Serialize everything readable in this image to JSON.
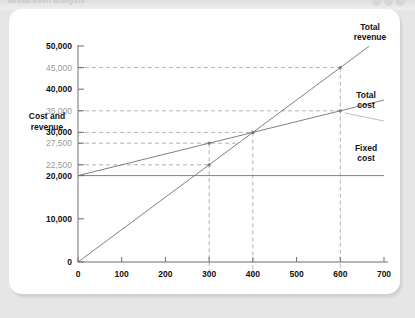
{
  "window": {
    "title": "Break-even analysis",
    "dots": [
      "window-dot",
      "window-dot",
      "window-dot"
    ]
  },
  "chart_data": {
    "type": "line",
    "title": "",
    "xlabel": "Sales per year",
    "ylabel": "Cost and revenue",
    "ylabel_line1": "Cost and",
    "ylabel_line2": "revenue",
    "xlim": [
      0,
      700
    ],
    "ylim": [
      0,
      50000
    ],
    "grid": false,
    "legend_position": "right-inline-labels",
    "x_ticks": [
      0,
      100,
      200,
      300,
      400,
      500,
      600,
      700
    ],
    "x_tick_labels": [
      "0",
      "100",
      "200",
      "300",
      "400",
      "500",
      "600",
      "700"
    ],
    "y_ticks_major": [
      0,
      10000,
      20000,
      30000,
      40000,
      50000
    ],
    "y_tick_labels_major": [
      "0",
      "10,000",
      "20,000",
      "30,000",
      "40,000",
      "50,000"
    ],
    "y_ticks_annotation": [
      22500,
      27500,
      35000,
      45000
    ],
    "y_tick_labels_annotation": [
      "22,500",
      "27,500",
      "35,000",
      "45,000"
    ],
    "series": [
      {
        "name": "Total revenue",
        "label": "Total revenue",
        "label_line1": "Total",
        "label_line2": "revenue",
        "color": "#808080",
        "intercept": 0,
        "slope_per_unit": 75,
        "x": [
          0,
          700
        ],
        "values": [
          0,
          52500
        ],
        "points": [
          {
            "x": 300,
            "y": 22500
          },
          {
            "x": 400,
            "y": 30000
          },
          {
            "x": 600,
            "y": 45000
          }
        ]
      },
      {
        "name": "Total cost",
        "label": "Total cost",
        "label_line1": "Total",
        "label_line2": "cost",
        "color": "#808080",
        "intercept": 20000,
        "slope_per_unit": 25,
        "x": [
          0,
          700
        ],
        "values": [
          20000,
          37500
        ],
        "points": [
          {
            "x": 300,
            "y": 27500
          },
          {
            "x": 400,
            "y": 30000
          },
          {
            "x": 600,
            "y": 35000
          }
        ]
      },
      {
        "name": "Fixed cost",
        "label": "Fixed cost",
        "label_line1": "Fixed",
        "label_line2": "cost",
        "color": "#808080",
        "intercept": 20000,
        "slope_per_unit": 0,
        "x": [
          0,
          700
        ],
        "values": [
          20000,
          20000
        ],
        "points": []
      }
    ],
    "annotations": {
      "breakeven": {
        "x": 400,
        "y": 30000
      },
      "guide_x_values": [
        300,
        400,
        600
      ],
      "guide_y_values": [
        22500,
        27500,
        30000,
        35000,
        45000
      ]
    }
  }
}
